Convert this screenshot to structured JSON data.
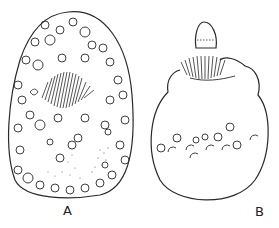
{
  "figure": {
    "panels": [
      {
        "label": "A",
        "description": "Oval cell with numerous circular granules, central striated (brush-like) structure, stippled regions near bottom"
      },
      {
        "label": "B",
        "description": "Rounded body with apical knob, striated collar beneath knob, row of small circles across middle"
      }
    ],
    "colors": {
      "ink": "#2a2a2a",
      "background": "#ffffff"
    }
  }
}
